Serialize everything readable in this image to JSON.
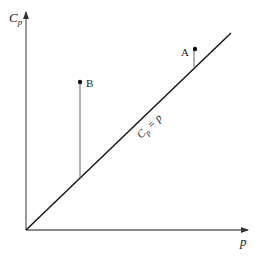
{
  "diagram": {
    "y_axis_label": "C",
    "y_axis_label_sub": "p",
    "x_axis_label": "p",
    "line_label_main": "C",
    "line_label_sub": "p",
    "line_label_rest": " = p",
    "points": [
      {
        "label": "A",
        "description": "point above the line Cp = p, near upper right"
      },
      {
        "label": "B",
        "description": "point far above the line Cp = p, upper left"
      }
    ],
    "colors": {
      "axis": "#555555",
      "line": "#111111",
      "point": "#111111",
      "text": "#222222"
    }
  }
}
